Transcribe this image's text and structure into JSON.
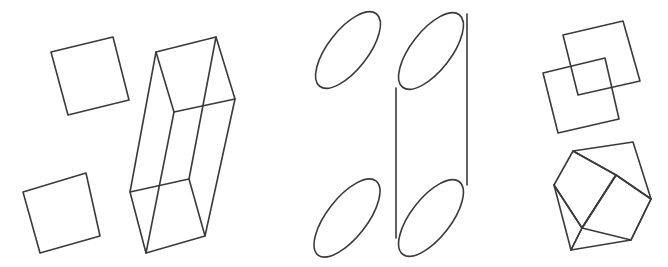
{
  "figure": {
    "background_color": "#ffffff",
    "stroke_color": "#3a3a3a",
    "stroke_width": 1.6,
    "canvas": {
      "width": 668,
      "height": 267
    },
    "groups": [
      {
        "id": "squares-and-box",
        "name": "squares-and-rectangular-box-group",
        "description": "Two tilted outline squares on the left and a wireframe rectangular box (prism)"
      },
      {
        "id": "ellipses-and-cylinder",
        "name": "ellipses-and-cylinder-group",
        "description": "Two tilted outline ellipses and a wireframe cylinder built from two ellipses and two side lines"
      },
      {
        "id": "overlapping-squares-and-cube",
        "name": "overlapping-squares-and-cube-group",
        "description": "Two overlapping tilted squares above a transparent wireframe cube"
      }
    ],
    "shapes": {
      "square_top_left": {
        "name": "square-top-left",
        "points": "51,52 113,37 129,100 68,115"
      },
      "square_bottom_left": {
        "name": "square-bottom-left",
        "points": "23,192 86,173 100,236 40,253"
      },
      "rect_box": {
        "name": "rectangular-box-wireframe",
        "top_face": "156,52 216,37 235,99 174,112",
        "bottom_face": "130,192 189,179 205,236 146,253",
        "edge_left_back": "156,52 130,192",
        "edge_front_left": "174,112 146,253",
        "edge_front_right": "235,99 205,236",
        "edge_back_right": "216,37 189,179"
      },
      "ellipse_top_left": {
        "name": "ellipse-top-left",
        "cx": 348,
        "cy": 50,
        "rx": 46,
        "ry": 20,
        "rotation": -52
      },
      "ellipse_bottom_left": {
        "name": "ellipse-bottom-left",
        "cx": 347,
        "cy": 218,
        "rx": 47,
        "ry": 20,
        "rotation": -52
      },
      "cylinder": {
        "name": "cylinder-wireframe",
        "top_ellipse": {
          "cx": 431,
          "cy": 51,
          "rx": 46,
          "ry": 20,
          "rotation": -52
        },
        "bottom_ellipse": {
          "cx": 431,
          "cy": 218,
          "rx": 46,
          "ry": 20,
          "rotation": -52
        },
        "side_left": "396,88 396,238",
        "side_right": "467,14 467,185"
      },
      "square_overlap_back": {
        "name": "square-overlap-upper-right",
        "points": "563,35 623,21 640,81 578,95"
      },
      "square_overlap_front": {
        "name": "square-overlap-lower-left",
        "points": "543,73 605,58 619,119 558,133"
      },
      "cube": {
        "name": "cube-wireframe",
        "back_top_left": "573,151",
        "back_top_right": "633,142",
        "left_back": "554,185",
        "right_back": "651,199",
        "front_top": "616,175",
        "front_bottom_left": "571,250",
        "front_bottom_right": "631,240",
        "left_front_bottom": "582,228",
        "top_face": "573,151 633,142 651,199 616,175",
        "left_face": "554,185 573,151 616,175 582,228",
        "front_face": "582,228 616,175 651,199 631,240",
        "bottom_front": "554,185 582,228 571,250 631,240",
        "edge_left_vertical": "554,185 571,250",
        "edge_mid_vertical": "582,228 571,250",
        "edge_right_vertical": "651,199 631,240",
        "edge_front_vertical": "616,175 582,228"
      }
    }
  }
}
